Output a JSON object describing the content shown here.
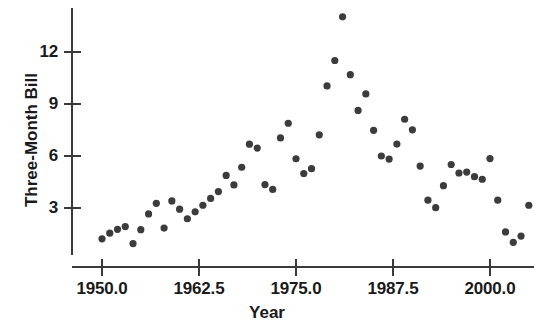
{
  "chart_data": {
    "type": "scatter",
    "title": "",
    "xlabel": "Year",
    "ylabel": "Three-Month Bill",
    "xlim": [
      1948.0,
      2011.0
    ],
    "ylim": [
      0.0,
      15.0
    ],
    "grid": false,
    "legend": null,
    "marker_color": "#3c3c3c",
    "axis_color": "#3a3a3a",
    "xticks": [
      1950.0,
      1962.5,
      1975.0,
      1987.5,
      2000.0
    ],
    "xtick_labels": [
      "1950.0",
      "1962.5",
      "1975.0",
      "1987.5",
      "2000.0"
    ],
    "yticks": [
      3,
      6,
      9,
      12
    ],
    "ytick_labels": [
      "3",
      "6",
      "9",
      "12"
    ],
    "x": [
      1950,
      1951,
      1952,
      1953,
      1954,
      1955,
      1956,
      1957,
      1958,
      1959,
      1960,
      1961,
      1962,
      1963,
      1964,
      1965,
      1966,
      1967,
      1968,
      1969,
      1970,
      1971,
      1972,
      1973,
      1974,
      1975,
      1976,
      1977,
      1978,
      1979,
      1980,
      1981,
      1982,
      1983,
      1984,
      1985,
      1986,
      1987,
      1988,
      1989,
      1990,
      1991,
      1992,
      1993,
      1994,
      1995,
      1996,
      1997,
      1998,
      1999,
      2000,
      2001,
      2002,
      2003,
      2004,
      2005
    ],
    "y": [
      1.22,
      1.55,
      1.77,
      1.93,
      0.95,
      1.75,
      2.66,
      3.27,
      1.84,
      3.41,
      2.93,
      2.38,
      2.78,
      3.16,
      3.55,
      3.95,
      4.88,
      4.33,
      5.35,
      6.68,
      6.46,
      4.35,
      4.07,
      7.04,
      7.89,
      5.84,
      4.99,
      5.27,
      7.22,
      10.04,
      11.51,
      14.03,
      10.69,
      8.63,
      9.58,
      7.48,
      6.0,
      5.82,
      6.69,
      8.12,
      7.51,
      5.42,
      3.45,
      3.02,
      4.29,
      5.51,
      5.02,
      5.07,
      4.81,
      4.66,
      5.85,
      3.45,
      1.62,
      1.02,
      1.38,
      3.16
    ]
  }
}
